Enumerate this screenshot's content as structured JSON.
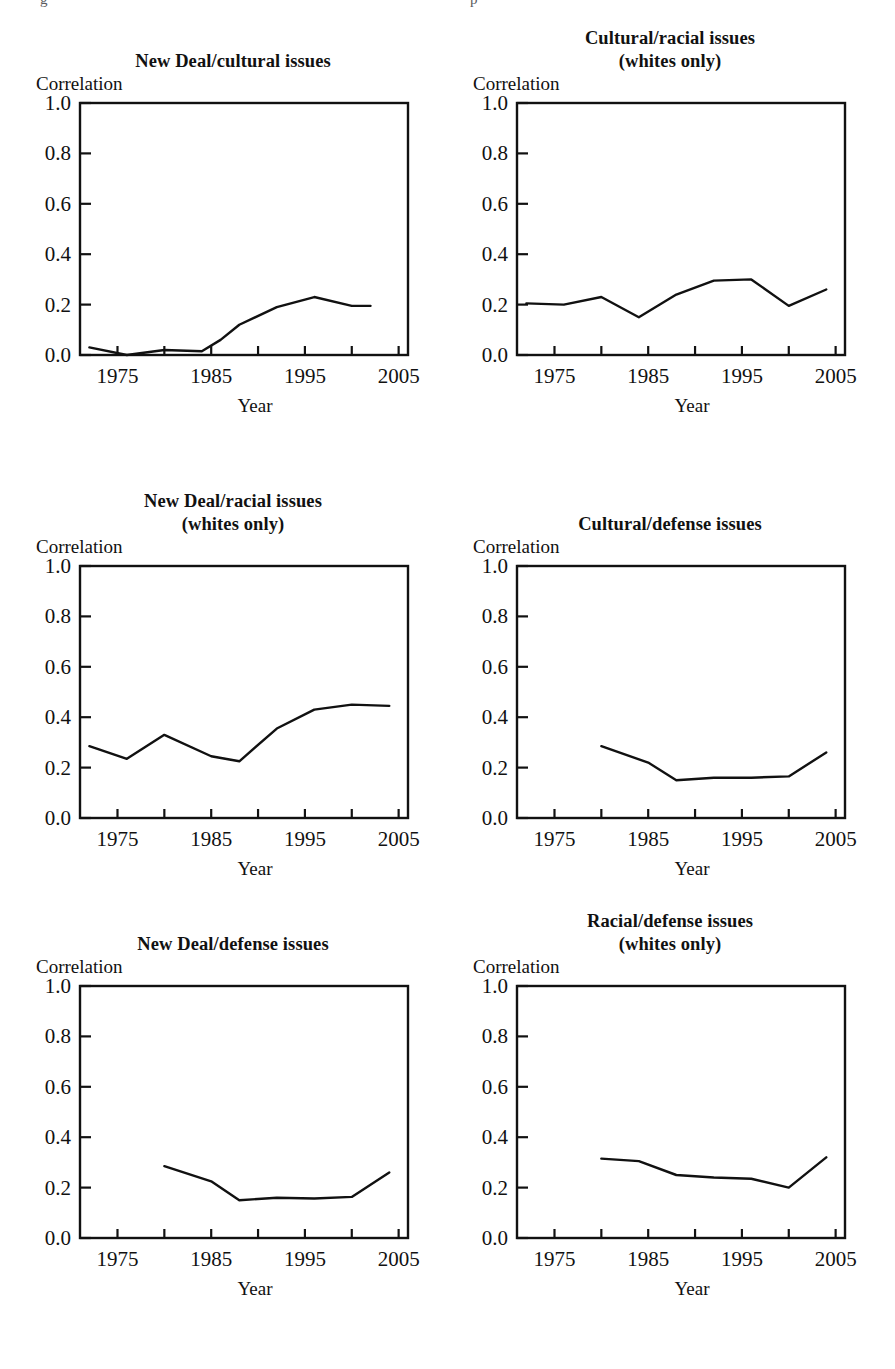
{
  "page": {
    "top_fragment_left": "g",
    "top_fragment_right": "p",
    "axis_color": "#111111",
    "line_color": "#111111",
    "background": "#ffffff"
  },
  "common": {
    "ylabel": "Correlation",
    "xlabel": "Year",
    "yticks": [
      "0.0",
      "0.2",
      "0.4",
      "0.6",
      "0.8",
      "1.0"
    ],
    "ytick_values": [
      0.0,
      0.2,
      0.4,
      0.6,
      0.8,
      1.0
    ],
    "xticks": [
      "1975",
      "1985",
      "1995",
      "2005"
    ],
    "xtick_values": [
      1975,
      1985,
      1995,
      2005
    ],
    "minor_xtick_values": [
      1980,
      1990,
      2000
    ],
    "xlim": [
      1971,
      2006
    ],
    "ylim": [
      0.0,
      1.0
    ]
  },
  "panels": [
    {
      "id": "new-deal-cultural",
      "title_line1": "New Deal/cultural issues",
      "title_line2": "",
      "chart_data": {
        "type": "line",
        "title": "New Deal/cultural issues",
        "xlabel": "Year",
        "ylabel": "Correlation",
        "xlim": [
          1971,
          2006
        ],
        "ylim": [
          0.0,
          1.0
        ],
        "grid": false,
        "legend": "none",
        "x": [
          1972,
          1976,
          1980,
          1984,
          1986,
          1988,
          1992,
          1996,
          2000,
          2002
        ],
        "values": [
          0.03,
          0.0,
          0.02,
          0.015,
          0.06,
          0.12,
          0.19,
          0.23,
          0.195,
          0.195
        ]
      }
    },
    {
      "id": "cultural-racial-whites",
      "title_line1": "Cultural/racial issues",
      "title_line2": "(whites only)",
      "chart_data": {
        "type": "line",
        "title": "Cultural/racial issues (whites only)",
        "xlabel": "Year",
        "ylabel": "Correlation",
        "xlim": [
          1971,
          2006
        ],
        "ylim": [
          0.0,
          1.0
        ],
        "grid": false,
        "legend": "none",
        "x": [
          1972,
          1976,
          1980,
          1984,
          1988,
          1992,
          1996,
          2000,
          2004
        ],
        "values": [
          0.205,
          0.2,
          0.23,
          0.15,
          0.24,
          0.295,
          0.3,
          0.195,
          0.26
        ]
      }
    },
    {
      "id": "new-deal-racial-whites",
      "title_line1": "New Deal/racial issues",
      "title_line2": "(whites only)",
      "chart_data": {
        "type": "line",
        "title": "New Deal/racial issues (whites only)",
        "xlabel": "Year",
        "ylabel": "Correlation",
        "xlim": [
          1971,
          2006
        ],
        "ylim": [
          0.0,
          1.0
        ],
        "grid": false,
        "legend": "none",
        "x": [
          1972,
          1976,
          1980,
          1985,
          1988,
          1992,
          1996,
          2000,
          2004
        ],
        "values": [
          0.285,
          0.235,
          0.33,
          0.245,
          0.225,
          0.355,
          0.43,
          0.45,
          0.445
        ]
      }
    },
    {
      "id": "cultural-defense",
      "title_line1": "Cultural/defense issues",
      "title_line2": "",
      "chart_data": {
        "type": "line",
        "title": "Cultural/defense issues",
        "xlabel": "Year",
        "ylabel": "Correlation",
        "xlim": [
          1971,
          2006
        ],
        "ylim": [
          0.0,
          1.0
        ],
        "grid": false,
        "legend": "none",
        "x": [
          1980,
          1985,
          1988,
          1992,
          1996,
          2000,
          2004
        ],
        "values": [
          0.285,
          0.22,
          0.15,
          0.16,
          0.16,
          0.165,
          0.26
        ]
      }
    },
    {
      "id": "new-deal-defense",
      "title_line1": "New Deal/defense issues",
      "title_line2": "",
      "chart_data": {
        "type": "line",
        "title": "New Deal/defense issues",
        "xlabel": "Year",
        "ylabel": "Correlation",
        "xlim": [
          1971,
          2006
        ],
        "ylim": [
          0.0,
          1.0
        ],
        "grid": false,
        "legend": "none",
        "x": [
          1980,
          1985,
          1988,
          1992,
          1996,
          2000,
          2004
        ],
        "values": [
          0.285,
          0.225,
          0.15,
          0.16,
          0.157,
          0.163,
          0.26
        ]
      }
    },
    {
      "id": "racial-defense-whites",
      "title_line1": "Racial/defense issues",
      "title_line2": "(whites only)",
      "chart_data": {
        "type": "line",
        "title": "Racial/defense issues (whites only)",
        "xlabel": "Year",
        "ylabel": "Correlation",
        "xlim": [
          1971,
          2006
        ],
        "ylim": [
          0.0,
          1.0
        ],
        "grid": false,
        "legend": "none",
        "x": [
          1980,
          1984,
          1988,
          1992,
          1996,
          2000,
          2004
        ],
        "values": [
          0.315,
          0.305,
          0.25,
          0.24,
          0.235,
          0.2,
          0.32
        ]
      }
    }
  ]
}
